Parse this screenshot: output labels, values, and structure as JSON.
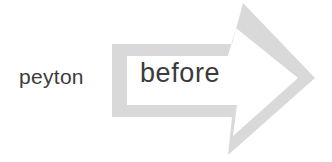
{
  "canvas": {
    "width": 332,
    "height": 162,
    "background_color": "#ffffff"
  },
  "labels": {
    "outside_text": "peyton",
    "inside_text": "before",
    "text_color": "#3b3b3b"
  },
  "arrow": {
    "icon_name": "right-arrow-outline",
    "direction": "right",
    "style": "outlined",
    "stroke_color": "#d9d9d9",
    "fill_color": "#ffffff",
    "outer_path": "M112,44 L232,44 L243,3 L315,78 L228,155 L232,117 L112,117 Z",
    "inner_path": "M127,56 L228,56 L236,28 L298,78 L233,136 L237,105 L127,105 Z"
  }
}
